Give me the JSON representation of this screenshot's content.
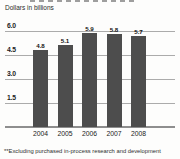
{
  "chart_data": {
    "type": "bar",
    "units_label": "Dollars in billions",
    "categories": [
      "2004",
      "2005",
      "2006",
      "2007",
      "2008"
    ],
    "values": [
      4.8,
      5.1,
      5.9,
      5.8,
      5.7
    ],
    "value_labels": [
      "4.8",
      "5.1",
      "5.9",
      "5.8",
      "5.7"
    ],
    "yticks": [
      1.5,
      3.0,
      4.5,
      6.0
    ],
    "ytick_labels": [
      "1.5",
      "3.0",
      "4.5",
      "6.0"
    ],
    "ylim": [
      0,
      6.4
    ],
    "grid": "horizontal",
    "legend": "none",
    "bar_color": "#4d4d4d",
    "footnote": "**Excluding purchased in-process research and development"
  }
}
